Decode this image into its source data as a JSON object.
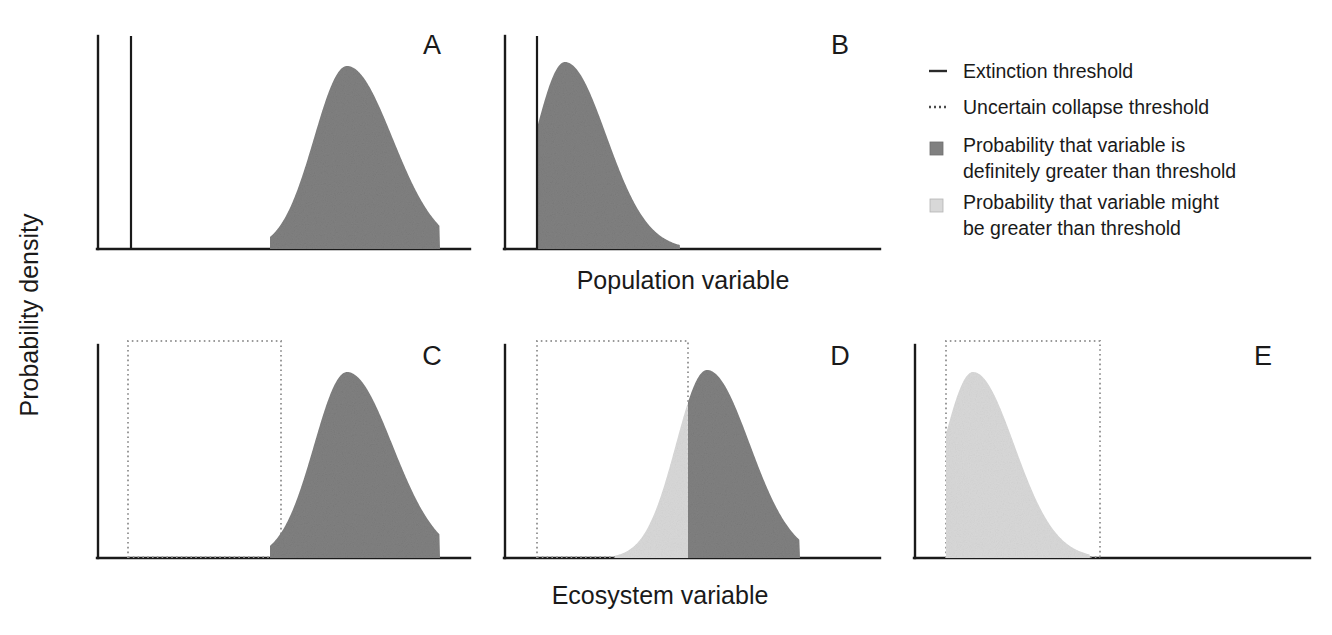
{
  "figure": {
    "y_axis_label": "Probability density",
    "x_axis_label_top": "Population variable",
    "x_axis_label_bottom": "Ecosystem variable"
  },
  "legend": {
    "items": [
      {
        "marker": "solid-line",
        "label": "Extinction threshold",
        "color": "#2a2a2a"
      },
      {
        "marker": "dotted-line",
        "label": "Uncertain collapse threshold",
        "color": "#4a4a4a"
      },
      {
        "marker": "dark-swatch",
        "label_line1": "Probability that variable is",
        "label_line2": "definitely greater than threshold",
        "color": "#808080"
      },
      {
        "marker": "light-swatch",
        "label_line1": "Probability that variable might",
        "label_line2": "be greater than threshold",
        "color": "#d8d8d8"
      }
    ]
  },
  "colors": {
    "dark_fill": "#808080",
    "light_fill": "#d8d8d8",
    "axis": "#1a1a1a",
    "dotted_threshold": "#9a9a9a",
    "background": "#ffffff"
  },
  "panels": [
    {
      "id": "A",
      "letter": "A",
      "row": 1,
      "threshold_type": "extinction",
      "threshold_style": "solid-line",
      "axis_x": 98,
      "baseline_y": 249,
      "axis_top_y": 36,
      "baseline_x_end": 470,
      "threshold_x": 131,
      "letter_x": 432,
      "letter_y": 54,
      "distribution": {
        "mean": 347,
        "sigma": 33,
        "peak_y": 66,
        "left_limit": 270,
        "right_limit": 440,
        "fill_dark_from": 270,
        "fill_light_from": null,
        "truncated_left": false
      },
      "overlap": "none"
    },
    {
      "id": "B",
      "letter": "B",
      "row": 1,
      "threshold_type": "extinction",
      "threshold_style": "solid-line",
      "axis_x": 505,
      "baseline_y": 249,
      "axis_top_y": 36,
      "baseline_x_end": 880,
      "threshold_x": 537,
      "letter_x": 840,
      "letter_y": 54,
      "distribution": {
        "mean": 565,
        "sigma": 30,
        "peak_y": 62,
        "left_limit": 537,
        "right_limit": 680,
        "fill_dark_from": 537,
        "fill_light_from": null,
        "truncated_left": true
      },
      "overlap": "truncated-at-threshold"
    },
    {
      "id": "C",
      "letter": "C",
      "row": 2,
      "threshold_type": "uncertain-collapse",
      "threshold_style": "dotted-box",
      "axis_x": 98,
      "baseline_y": 558,
      "axis_top_y": 345,
      "baseline_x_end": 470,
      "box_x1": 128,
      "box_x2": 281,
      "box_top_y": 341,
      "letter_x": 432,
      "letter_y": 365,
      "distribution": {
        "mean": 347,
        "sigma": 33,
        "peak_y": 372,
        "left_limit": 270,
        "right_limit": 440,
        "fill_dark_from": 270,
        "fill_light_from": null,
        "truncated_left": false
      },
      "overlap": "none"
    },
    {
      "id": "D",
      "letter": "D",
      "row": 2,
      "threshold_type": "uncertain-collapse",
      "threshold_style": "dotted-box",
      "axis_x": 505,
      "baseline_y": 558,
      "axis_top_y": 345,
      "baseline_x_end": 880,
      "box_x1": 537,
      "box_x2": 688,
      "box_top_y": 341,
      "letter_x": 840,
      "letter_y": 365,
      "distribution": {
        "mean": 707,
        "sigma": 31,
        "peak_y": 370,
        "left_limit": 615,
        "right_limit": 800,
        "fill_dark_from": 688,
        "fill_light_from": 615,
        "split_x": 688,
        "truncated_left": false
      },
      "overlap": "partial-split-at-box-edge"
    },
    {
      "id": "E",
      "letter": "E",
      "row": 2,
      "threshold_type": "uncertain-collapse",
      "threshold_style": "dotted-box",
      "axis_x": 915,
      "baseline_y": 558,
      "axis_top_y": 345,
      "baseline_x_end": 1310,
      "box_x1": 946,
      "box_x2": 1100,
      "box_top_y": 341,
      "letter_x": 1263,
      "letter_y": 365,
      "distribution": {
        "mean": 973,
        "sigma": 30,
        "peak_y": 372,
        "left_limit": 946,
        "right_limit": 1090,
        "fill_dark_from": null,
        "fill_light_from": 946,
        "truncated_left": true
      },
      "overlap": "entirely-within-box"
    }
  ],
  "chart_data": {
    "type": "area",
    "title": "",
    "xlabel": "Population variable / Ecosystem variable",
    "ylabel": "Probability density",
    "grid": false,
    "legend_position": "right",
    "series": [
      {
        "name": "A",
        "shape": "gaussian",
        "mean": 347,
        "sigma": 33,
        "threshold": 131,
        "threshold_kind": "solid",
        "dark_fraction": 1.0,
        "light_fraction": 0.0
      },
      {
        "name": "B",
        "shape": "gaussian-truncated",
        "mean": 565,
        "sigma": 30,
        "threshold": 537,
        "threshold_kind": "solid",
        "dark_fraction": 1.0,
        "light_fraction": 0.0
      },
      {
        "name": "C",
        "shape": "gaussian",
        "mean": 347,
        "sigma": 33,
        "threshold_low": 128,
        "threshold_high": 281,
        "threshold_kind": "dotted-box",
        "dark_fraction": 1.0,
        "light_fraction": 0.0
      },
      {
        "name": "D",
        "shape": "gaussian",
        "mean": 707,
        "sigma": 31,
        "threshold_low": 537,
        "threshold_high": 688,
        "threshold_kind": "dotted-box",
        "dark_fraction": 0.73,
        "light_fraction": 0.27
      },
      {
        "name": "E",
        "shape": "gaussian-truncated",
        "mean": 973,
        "sigma": 30,
        "threshold_low": 946,
        "threshold_high": 1100,
        "threshold_kind": "dotted-box",
        "dark_fraction": 0.0,
        "light_fraction": 1.0
      }
    ]
  }
}
